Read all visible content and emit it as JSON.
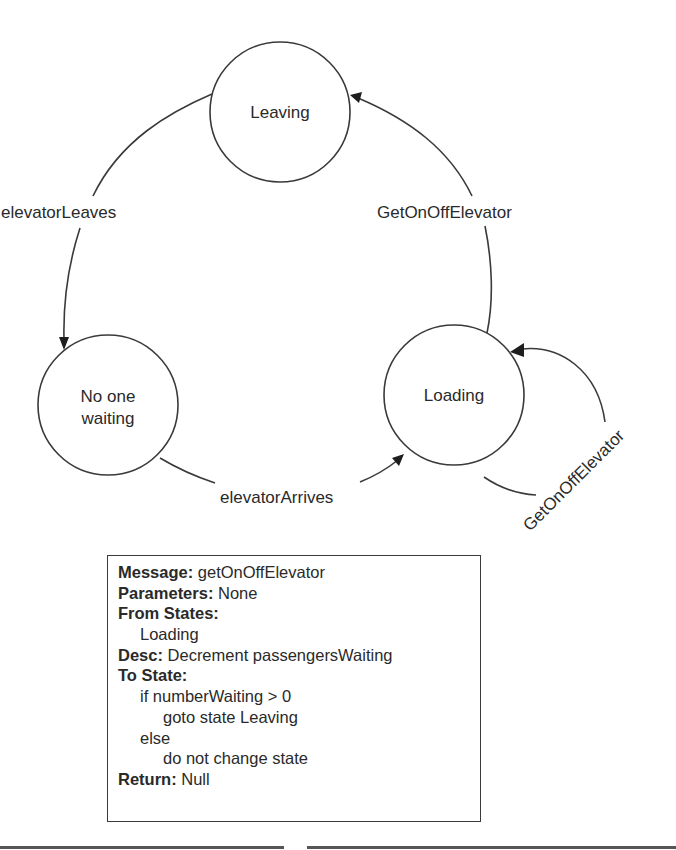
{
  "diagram": {
    "type": "state-machine",
    "states": [
      {
        "id": "leaving",
        "label": "Leaving",
        "cx": 280,
        "cy": 112,
        "r": 70
      },
      {
        "id": "no_one_waiting",
        "label_lines": [
          "No one",
          "waiting"
        ],
        "cx": 108,
        "cy": 405,
        "r": 70
      },
      {
        "id": "loading",
        "label": "Loading",
        "cx": 454,
        "cy": 395,
        "r": 70
      }
    ],
    "transitions": [
      {
        "from": "leaving",
        "to": "no_one_waiting",
        "label": "elevatorLeaves"
      },
      {
        "from": "no_one_waiting",
        "to": "loading",
        "label": "elevatorArrives"
      },
      {
        "from": "loading",
        "to": "leaving",
        "label": "GetOnOffElevator"
      },
      {
        "from": "loading",
        "to": "loading",
        "label": "GetOnOffElevator"
      }
    ]
  },
  "message_box": {
    "message_key": "Message:",
    "message_val": " getOnOffElevator",
    "parameters_key": "Parameters:",
    "parameters_val": " None",
    "from_states_key": "From States:",
    "from_states_val": "Loading",
    "desc_key": "Desc:",
    "desc_val": " Decrement passengersWaiting",
    "to_state_key": "To State:",
    "to_state_lines": [
      "if numberWaiting > 0",
      "goto state Leaving",
      "else",
      "do not change state"
    ],
    "return_key": "Return:",
    "return_val": " Null"
  }
}
